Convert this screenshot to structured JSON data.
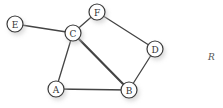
{
  "diagram": {
    "type": "undirected-graph",
    "nodes": [
      {
        "id": "E",
        "label": "E",
        "x": 15,
        "y": 24
      },
      {
        "id": "C",
        "label": "C",
        "x": 73,
        "y": 33
      },
      {
        "id": "F",
        "label": "F",
        "x": 97,
        "y": 12
      },
      {
        "id": "D",
        "label": "D",
        "x": 155,
        "y": 49
      },
      {
        "id": "A",
        "label": "A",
        "x": 56,
        "y": 89
      },
      {
        "id": "B",
        "label": "B",
        "x": 129,
        "y": 90
      }
    ],
    "edges": [
      {
        "from": "E",
        "to": "C",
        "weight": "normal"
      },
      {
        "from": "C",
        "to": "F",
        "weight": "normal"
      },
      {
        "from": "F",
        "to": "D",
        "weight": "normal"
      },
      {
        "from": "D",
        "to": "B",
        "weight": "normal"
      },
      {
        "from": "C",
        "to": "A",
        "weight": "normal"
      },
      {
        "from": "C",
        "to": "B",
        "weight": "thick"
      },
      {
        "from": "A",
        "to": "B",
        "weight": "normal"
      }
    ],
    "side_label": "R",
    "colors": {
      "edge": "#444444",
      "node_stroke": "#3a3a3a",
      "node_fill": "#ffffff"
    }
  }
}
